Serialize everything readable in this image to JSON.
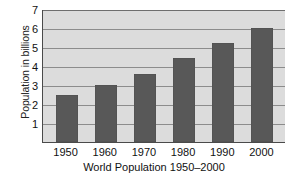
{
  "chart_data": {
    "type": "bar",
    "title": "",
    "xlabel": "World Population 1950–2000",
    "ylabel": "Population in billions",
    "categories": [
      "1950",
      "1960",
      "1970",
      "1980",
      "1990",
      "2000"
    ],
    "values": [
      2.5,
      3.0,
      3.6,
      4.4,
      5.2,
      6.0
    ],
    "series": [
      {
        "name": "World population",
        "values": [
          2.5,
          3.0,
          3.6,
          4.4,
          5.2,
          6.0
        ]
      }
    ],
    "ylim": [
      0,
      7
    ],
    "yticks": [
      1,
      2,
      3,
      4,
      5,
      6,
      7
    ],
    "ytick_labels": [
      "1",
      "2",
      "3",
      "4",
      "5",
      "6",
      "7"
    ],
    "grid": true,
    "grid_axis": "y",
    "legend": false,
    "legend_position": "none",
    "bar_color": "#585858",
    "plot_background": "#dcdcdc",
    "gridline_color": "#8c8c8c",
    "axis_color": "#4a4a4a",
    "figure_background": "#ffffff"
  }
}
